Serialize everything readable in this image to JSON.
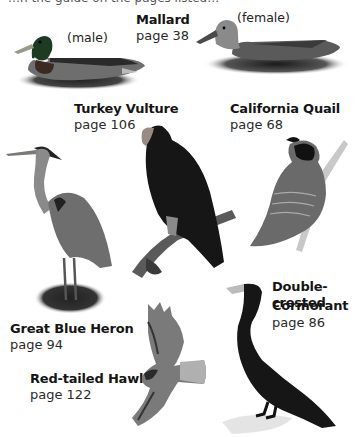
{
  "header_fragment": "…n the guide on the pages listed…",
  "birds": [
    {
      "name": "Mallard",
      "page": "page 38",
      "variants": [
        "(male)",
        "(female)"
      ]
    },
    {
      "name": "Turkey Vulture",
      "page": "page 106"
    },
    {
      "name": "California Quail",
      "page": "page 68"
    },
    {
      "name": "Great Blue Heron",
      "page": "page 94"
    },
    {
      "name": "Double-crested",
      "name2": "Cormorant",
      "page": "page 86"
    },
    {
      "name": "Red-tailed Hawk",
      "page": "page 122"
    }
  ]
}
